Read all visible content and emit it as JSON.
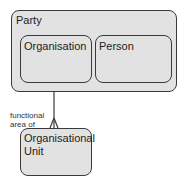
{
  "diagram": {
    "entities": {
      "party": {
        "label": "Party"
      },
      "organisation": {
        "label": "Organisation"
      },
      "person": {
        "label": "Person"
      },
      "org_unit": {
        "label_line1": "Organisational",
        "label_line2": "Unit"
      }
    },
    "relationship": {
      "label_line1": "functional",
      "label_line2": "area of",
      "from": "Organisational Unit",
      "to": "Organisation",
      "cardinality": "many-to-one"
    },
    "colors": {
      "fill": "#e2e2e2",
      "stroke": "#3a3a3a"
    }
  }
}
